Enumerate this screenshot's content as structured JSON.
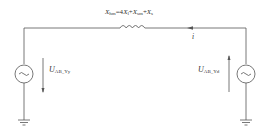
{
  "diagram": {
    "reactance_label": {
      "symbol": "X",
      "sub": "hm",
      "expr_parts": [
        {
          "text": "=4",
          "kind": "plain"
        },
        {
          "text": "X",
          "kind": "var",
          "sub": "l"
        },
        {
          "text": "+",
          "kind": "plain"
        },
        {
          "text": "X",
          "kind": "var",
          "sub": "sm"
        },
        {
          "text": "+",
          "kind": "plain"
        },
        {
          "text": "X",
          "kind": "var",
          "sub": "s"
        }
      ]
    },
    "current_label": "i",
    "left_source": {
      "voltage_symbol": "U",
      "voltage_sub": "AB_Yy",
      "arrow_direction": "down"
    },
    "right_source": {
      "voltage_symbol": "U",
      "voltage_sub": "AB_Yd",
      "arrow_direction": "up"
    },
    "colors": {
      "wire": "#555555",
      "text": "#333333",
      "background": "#ffffff"
    }
  }
}
